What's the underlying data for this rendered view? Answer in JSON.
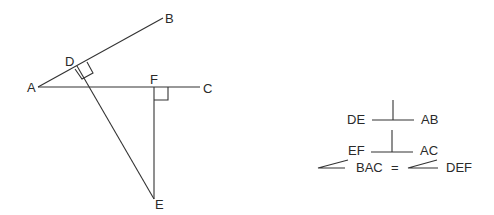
{
  "diagram": {
    "type": "geometry",
    "points": {
      "A": {
        "label": "A",
        "x": 38,
        "y": 87
      },
      "B": {
        "label": "B",
        "x": 163,
        "y": 18
      },
      "C": {
        "label": "C",
        "x": 200,
        "y": 87
      },
      "D": {
        "label": "D",
        "x": 77,
        "y": 66
      },
      "F": {
        "label": "F",
        "x": 154,
        "y": 87
      },
      "E": {
        "label": "E",
        "x": 154,
        "y": 199
      }
    },
    "segments": [
      {
        "from": "A",
        "to": "B"
      },
      {
        "from": "A",
        "to": "C"
      },
      {
        "from": "D",
        "to": "E"
      },
      {
        "from": "F",
        "to": "E"
      }
    ],
    "right_angles": [
      "D",
      "F"
    ],
    "line_color": "#333333"
  },
  "statements": {
    "line1": {
      "left": "DE",
      "symbol": "perpendicular",
      "right": "AB"
    },
    "line2": {
      "left": "EF",
      "symbol": "perpendicular",
      "right": "AC"
    },
    "line3": {
      "angle1": "BAC",
      "equals": "=",
      "angle2": "DEF"
    }
  }
}
